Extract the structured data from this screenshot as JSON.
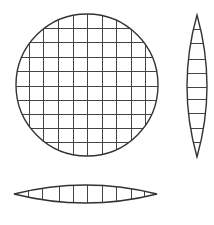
{
  "diagram": {
    "type": "geometric-projection",
    "colors": {
      "stroke": "#333333",
      "grid": "#444444",
      "background": "#ffffff"
    },
    "disc": {
      "cx": 87,
      "cy": 85,
      "r": 71,
      "grid_x": [
        29,
        43,
        58,
        73,
        87,
        102,
        116,
        131,
        145
      ],
      "grid_y": [
        28,
        42,
        57,
        71,
        86,
        100,
        114,
        128,
        142
      ]
    },
    "side_view_vertical": {
      "cx": 197,
      "top": 15,
      "bottom": 157,
      "half_width": 10,
      "lines_y": [
        29,
        43,
        59,
        73,
        87,
        99,
        113,
        128,
        142
      ]
    },
    "side_view_horizontal": {
      "cy": 194,
      "left": 14,
      "right": 157,
      "half_height": 9,
      "lines_x": [
        28,
        42,
        59,
        73,
        87,
        102,
        116,
        131,
        144
      ]
    }
  }
}
